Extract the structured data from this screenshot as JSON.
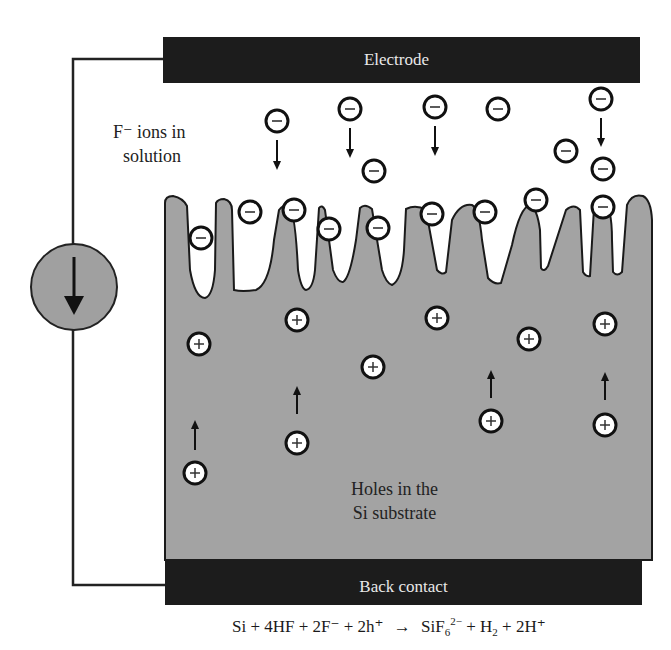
{
  "electrode": {
    "label": "Electrode"
  },
  "back_contact": {
    "label": "Back contact"
  },
  "solution_label": {
    "line1": "F⁻ ions in",
    "line2": "solution"
  },
  "substrate_label": {
    "line1": "Holes in the",
    "line2": "Si substrate"
  },
  "equation": {
    "lhs": "Si + 4HF + 2F⁻ + 2h⁺",
    "arrow": "→",
    "rhs_a": "SiF",
    "rhs_sub": "6",
    "rhs_sup": "2−",
    "rhs_b": " + H",
    "rhs_sub2": "2",
    "rhs_c": " + 2H⁺"
  },
  "current_source": {
    "icon": "down-arrow",
    "fill": "#a0a0a0"
  },
  "colors": {
    "substrate": "#a3a3a3",
    "bar": "#1c1c1c",
    "ion_fill": "#ffffff",
    "outline": "#111111"
  },
  "negative_ions": [
    [
      277,
      121
    ],
    [
      350,
      109
    ],
    [
      435,
      107
    ],
    [
      498,
      109
    ],
    [
      601,
      99
    ],
    [
      374,
      171
    ],
    [
      566,
      151
    ],
    [
      603,
      169
    ],
    [
      201,
      238
    ],
    [
      250,
      212
    ],
    [
      294,
      210
    ],
    [
      329,
      229
    ],
    [
      378,
      228
    ],
    [
      432,
      214
    ],
    [
      485,
      212
    ],
    [
      536,
      200
    ],
    [
      603,
      207
    ]
  ],
  "holes": [
    [
      199,
      344
    ],
    [
      297,
      320
    ],
    [
      373,
      367
    ],
    [
      437,
      318
    ],
    [
      529,
      339
    ],
    [
      605,
      324
    ],
    [
      195,
      473
    ],
    [
      297,
      443
    ],
    [
      491,
      421
    ],
    [
      605,
      425
    ]
  ],
  "hole_arrows": [
    [
      195,
      450,
      420
    ],
    [
      297,
      414,
      386
    ],
    [
      491,
      398,
      370
    ],
    [
      605,
      400,
      372
    ]
  ],
  "ion_arrows": [
    [
      277,
      140,
      170
    ],
    [
      350,
      128,
      158
    ],
    [
      435,
      126,
      156
    ],
    [
      601,
      118,
      147
    ]
  ]
}
